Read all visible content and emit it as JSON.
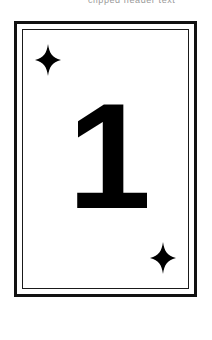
{
  "page": {
    "background_color": "#ffffff",
    "width": 212,
    "height": 340
  },
  "top_strip": {
    "clipped_text": "clipped header text"
  },
  "card": {
    "rank": "1",
    "suit_symbol": "✦",
    "suit_name": "four-pointed-star-diamond",
    "face_color": "#ffffff",
    "ink_color": "#000000",
    "outer_border_color": "#111111",
    "inner_border_color": "#1a1a1a",
    "pips": [
      {
        "position": "top-left",
        "symbol": "✦"
      },
      {
        "position": "bottom-right",
        "symbol": "✦"
      }
    ]
  }
}
